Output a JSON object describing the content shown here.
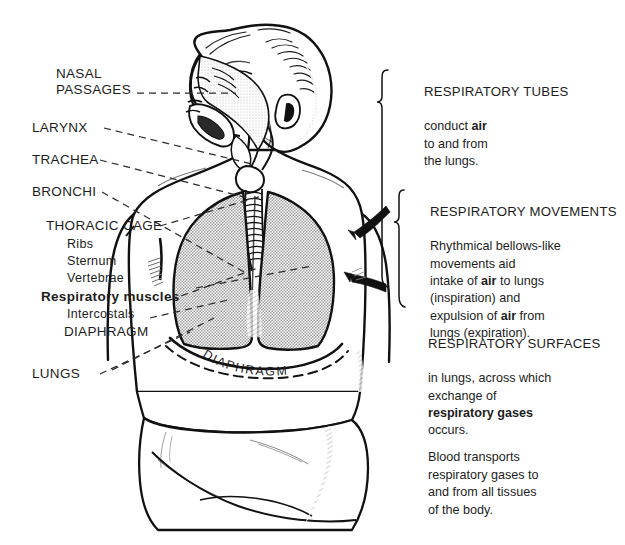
{
  "figure": {
    "internal_labels": [
      {
        "name": "diaphragm-curve-label",
        "text": "DIAPHRAGM"
      }
    ]
  },
  "left_labels": [
    {
      "name": "nasal-passages",
      "lines": [
        "NASAL",
        "PASSAGES"
      ],
      "style": "caps"
    },
    {
      "name": "larynx",
      "lines": [
        "LARYNX"
      ],
      "style": "caps"
    },
    {
      "name": "trachea",
      "lines": [
        "TRACHEA"
      ],
      "style": "caps"
    },
    {
      "name": "bronchi",
      "lines": [
        "BRONCHI"
      ],
      "style": "caps"
    },
    {
      "name": "thoracic-cage",
      "lines": [
        "THORACIC CAGE"
      ],
      "style": "caps"
    },
    {
      "name": "ribs",
      "lines": [
        "Ribs"
      ],
      "style": "sub"
    },
    {
      "name": "sternum",
      "lines": [
        "Sternum"
      ],
      "style": "sub"
    },
    {
      "name": "vertebrae",
      "lines": [
        "Vertebrae"
      ],
      "style": "sub"
    },
    {
      "name": "respiratory-muscles",
      "lines": [
        "Respiratory muscles"
      ],
      "style": "bold"
    },
    {
      "name": "intercostals",
      "lines": [
        "Intercostals"
      ],
      "style": "sub"
    },
    {
      "name": "diaphragm",
      "lines": [
        "DIAPHRAGM"
      ],
      "style": "caps"
    },
    {
      "name": "lungs",
      "lines": [
        "LUNGS"
      ],
      "style": "caps"
    }
  ],
  "right_blocks": [
    {
      "name": "respiratory-tubes",
      "heading": "RESPIRATORY TUBES",
      "body": "conduct air\nto and from\nthe lungs.",
      "bold_terms": [
        "air"
      ]
    },
    {
      "name": "respiratory-movements",
      "heading": "RESPIRATORY MOVEMENTS",
      "body": "Rhythmical bellows-like\nmovements aid\nintake of air to lungs\n(inspiration) and\nexpulsion of air from\nlungs (expiration).",
      "bold_terms": [
        "air"
      ]
    },
    {
      "name": "respiratory-surfaces",
      "heading": "RESPIRATORY SURFACES",
      "body": "in lungs, across which\nexchange of\nrespiratory gases\noccurs.",
      "bold_terms": [
        "respiratory gases"
      ]
    },
    {
      "name": "blood-transport",
      "heading": "",
      "body": "Blood transports\nrespiratory gases to\nand from all tissues\nof the body.",
      "bold_terms": []
    }
  ],
  "colors": {
    "ink": "#1a1a1a",
    "lung_fill": "#c9c9c9",
    "skin_fill": "#ffffff",
    "background": "#ffffff",
    "shade": "#d6d6d6"
  }
}
